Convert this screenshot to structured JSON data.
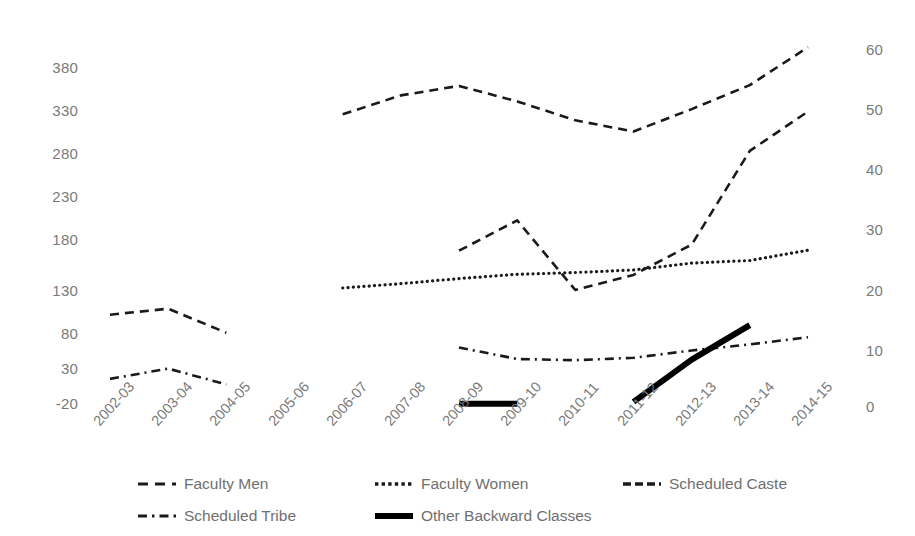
{
  "chart_data": {
    "type": "line",
    "title": "",
    "xlabel": "",
    "ylabel": "",
    "grid": false,
    "legend_position": "bottom",
    "categories": [
      "2002-03",
      "2003-04",
      "2004-05",
      "2005-06",
      "2006-07",
      "2007-08",
      "2008-09",
      "2009-10",
      "2010-11",
      "2011-12",
      "2012-13",
      "2013-14",
      "2014-15"
    ],
    "y_left": {
      "ticks": [
        "-20",
        "30",
        "80",
        "130",
        "180",
        "230",
        "280",
        "330",
        "380"
      ],
      "tick_values": [
        -20,
        30,
        80,
        130,
        180,
        230,
        280,
        330,
        380
      ],
      "ylim": [
        -20,
        380
      ]
    },
    "y_right": {
      "ticks": [
        "0",
        "10",
        "20",
        "30",
        "40",
        "50",
        "60"
      ],
      "tick_values": [
        0,
        10,
        20,
        30,
        40,
        50,
        60
      ],
      "ylim": [
        0,
        60
      ]
    },
    "series": [
      {
        "name": "Faculty Men",
        "axis": "left",
        "style": "dashed",
        "color": "#1a1a1a",
        "values": [
          92,
          99,
          71,
          null,
          325,
          347,
          358,
          340,
          318,
          305,
          331,
          359,
          403
        ]
      },
      {
        "name": "Faculty Women",
        "axis": "left",
        "style": "dotted",
        "color": "#1a1a1a",
        "values": [
          null,
          null,
          null,
          null,
          123,
          128,
          134,
          139,
          141,
          144,
          152,
          155,
          167
        ]
      },
      {
        "name": "Scheduled Caste",
        "axis": "right",
        "style": "dashed",
        "color": "#1a1a1a",
        "values": [
          null,
          null,
          null,
          null,
          null,
          null,
          26.5,
          31.5,
          20.0,
          22.5,
          27.5,
          43.0,
          49.5
        ]
      },
      {
        "name": "Scheduled Tribe",
        "axis": "right",
        "style": "dash-dot",
        "color": "#1a1a1a",
        "values": [
          5.3,
          7.0,
          4.4,
          null,
          null,
          null,
          10.5,
          8.6,
          8.4,
          8.8,
          10.0,
          11.0,
          12.2
        ]
      },
      {
        "name": "Other Backward Classes",
        "axis": "right",
        "style": "solid-thick",
        "color": "#000000",
        "values": [
          null,
          null,
          null,
          null,
          null,
          null,
          1.2,
          1.2,
          null,
          1.5,
          8.5,
          14.2,
          null
        ]
      }
    ]
  },
  "legend": {
    "items": [
      {
        "label": "Faculty Men",
        "swatch": "dashed-swatch"
      },
      {
        "label": "Faculty Women",
        "swatch": "dotted-swatch"
      },
      {
        "label": "Scheduled Caste",
        "swatch": "dashed-swatch"
      },
      {
        "label": "Scheduled Tribe",
        "swatch": "dash-dot-swatch"
      },
      {
        "label": "Other Backward Classes",
        "swatch": "solid-thick-swatch"
      }
    ]
  }
}
